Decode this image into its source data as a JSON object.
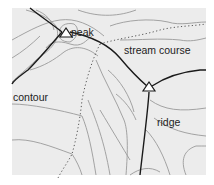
{
  "diagram": {
    "type": "topographic map features",
    "background": "#ececec",
    "labels": {
      "peak": "peak",
      "stream": "stream course",
      "contour": "contour",
      "ridge": "ridge"
    },
    "colors": {
      "contour_line": "#9a9a9a",
      "ridge_line": "#1a1a1a",
      "stream_line": "#555555",
      "marker": "#1a1a1a"
    },
    "markers": [
      {
        "name": "peak",
        "shape": "triangle",
        "x": 66,
        "y": 33
      },
      {
        "name": "ridge-summit",
        "shape": "triangle",
        "x": 149,
        "y": 87
      }
    ]
  }
}
